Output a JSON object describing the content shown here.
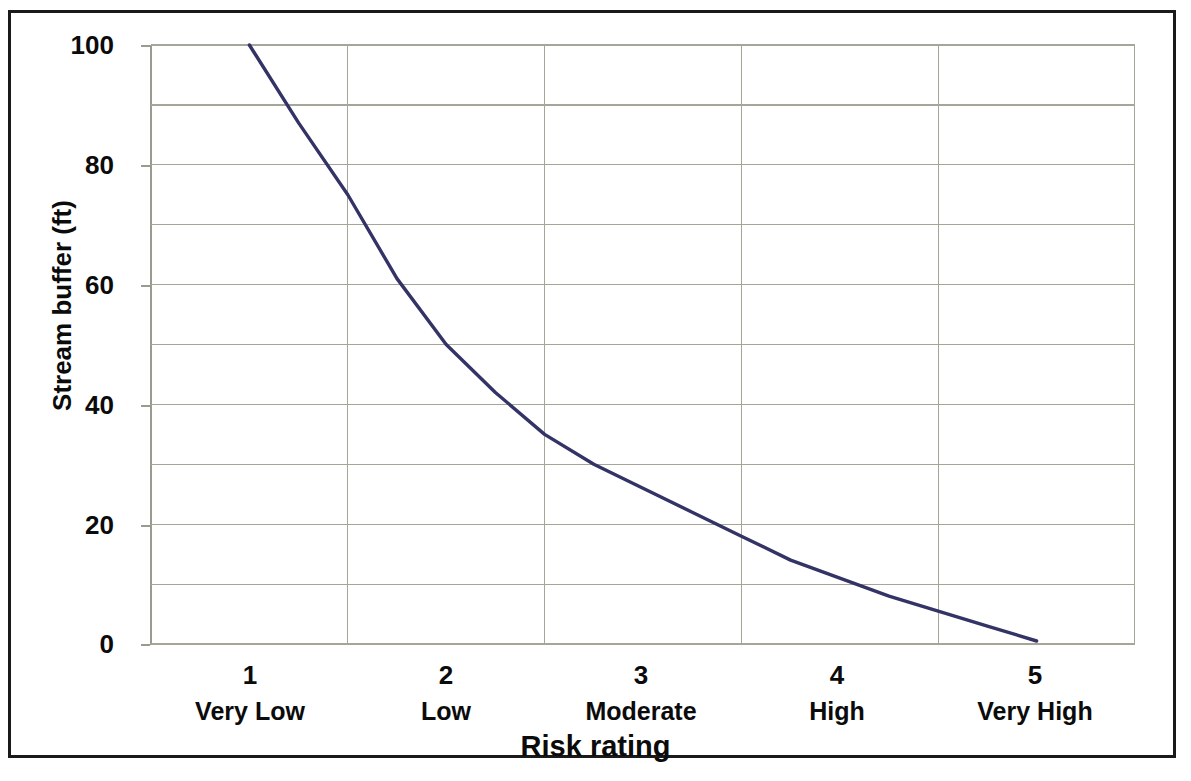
{
  "chart_data": {
    "type": "line",
    "title": "",
    "xlabel": "Risk rating",
    "ylabel": "Stream buffer (ft)",
    "xlim": [
      0.5,
      5.5
    ],
    "ylim": [
      0,
      100
    ],
    "grid": true,
    "legend": "none",
    "line_color": "#333366",
    "gridline_color": "#a6a698",
    "axis_color": "#9a9a8f",
    "y_ticks": [
      100,
      80,
      60,
      40,
      20,
      0
    ],
    "y_tick_labels": [
      "100",
      "80",
      "60",
      "40",
      "20",
      "0"
    ],
    "y_minor_gridlines": [
      90,
      70,
      50,
      30,
      10
    ],
    "x_ticks": [
      1,
      2,
      3,
      4,
      5
    ],
    "x_tick_labels": [
      "1",
      "2",
      "3",
      "4",
      "5"
    ],
    "x_category_names": [
      "Very Low",
      "Low",
      "Moderate",
      "High",
      "Very High"
    ],
    "series": [
      {
        "name": "Stream buffer",
        "x": [
          1.0,
          1.25,
          1.5,
          1.75,
          2.0,
          2.25,
          2.5,
          2.75,
          3.0,
          3.25,
          3.5,
          3.75,
          4.0,
          4.25,
          4.5,
          4.75,
          5.0
        ],
        "values": [
          100,
          87,
          75,
          61,
          50,
          42,
          35,
          30,
          26,
          22,
          18,
          14,
          11,
          8,
          5.5,
          3,
          0.5
        ]
      }
    ],
    "annotations": []
  },
  "axis": {
    "y_title": "Stream buffer (ft)",
    "x_title": "Risk rating"
  }
}
